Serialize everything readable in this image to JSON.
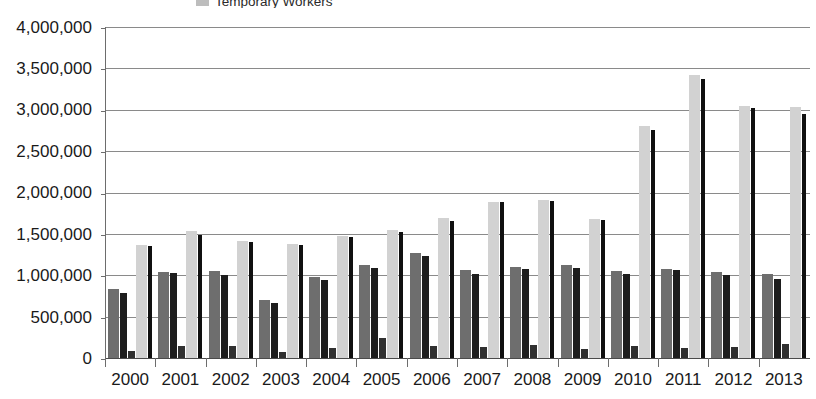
{
  "legend": {
    "items": [
      {
        "label": "Temporary Workers",
        "swatch_color": "#bdbdbd",
        "icon": "legend-swatch-icon"
      }
    ]
  },
  "axes": {
    "y_ticks": [
      "4,000,000",
      "3,500,000",
      "3,000,000",
      "2,500,000",
      "2,000,000",
      "1,500,000",
      "1,000,000",
      "500,000",
      "0"
    ],
    "x_ticks": [
      "2000",
      "2001",
      "2002",
      "2003",
      "2004",
      "2005",
      "2006",
      "2007",
      "2008",
      "2009",
      "2010",
      "2011",
      "2012",
      "2013"
    ]
  },
  "colors": {
    "series_1": "#6e6e6e",
    "series_2": "#1d1d1d",
    "series_3": "#303030",
    "series_4": "#d2d2d2",
    "series_5": "#101010",
    "gridline": "#8a8a8a",
    "axis": "#6d6d6d",
    "background": "#ffffff"
  },
  "chart_data": {
    "type": "bar",
    "title": "",
    "subtitle": "",
    "xlabel": "",
    "ylabel": "",
    "ylim": [
      0,
      4000000
    ],
    "ytick_step": 500000,
    "grid": true,
    "legend_position": "top-center",
    "categories": [
      "2000",
      "2001",
      "2002",
      "2003",
      "2004",
      "2005",
      "2006",
      "2007",
      "2008",
      "2009",
      "2010",
      "2011",
      "2012",
      "2013"
    ],
    "series": [
      {
        "name": "Series 1",
        "color": "#6e6e6e",
        "values": [
          830000,
          1040000,
          1050000,
          700000,
          980000,
          1120000,
          1270000,
          1060000,
          1100000,
          1130000,
          1050000,
          1070000,
          1040000,
          1020000
        ]
      },
      {
        "name": "Series 2",
        "color": "#1d1d1d",
        "values": [
          790000,
          1030000,
          1000000,
          660000,
          940000,
          1090000,
          1230000,
          1010000,
          1080000,
          1090000,
          1020000,
          1060000,
          1000000,
          960000
        ]
      },
      {
        "name": "Series 3",
        "color": "#303030",
        "values": [
          80000,
          150000,
          140000,
          70000,
          120000,
          240000,
          150000,
          130000,
          160000,
          110000,
          140000,
          120000,
          130000,
          170000
        ]
      },
      {
        "name": "Temporary Workers",
        "color": "#d2d2d2",
        "values": [
          1360000,
          1530000,
          1410000,
          1380000,
          1470000,
          1550000,
          1690000,
          1880000,
          1910000,
          1680000,
          2800000,
          3420000,
          3050000,
          3030000
        ]
      },
      {
        "name": "Series 5",
        "color": "#101010",
        "values": [
          1350000,
          1490000,
          1400000,
          1370000,
          1460000,
          1520000,
          1650000,
          1880000,
          1900000,
          1670000,
          2760000,
          3370000,
          3020000,
          2950000
        ]
      }
    ]
  }
}
